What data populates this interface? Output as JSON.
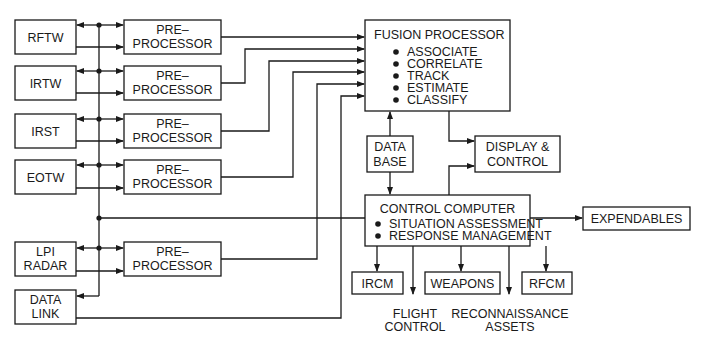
{
  "diagram": {
    "type": "block-diagram",
    "sensors": [
      {
        "id": "rftw",
        "lines": [
          "RFTW"
        ]
      },
      {
        "id": "irtw",
        "lines": [
          "IRTW"
        ]
      },
      {
        "id": "irst",
        "lines": [
          "IRST"
        ]
      },
      {
        "id": "eotw",
        "lines": [
          "EOTW"
        ]
      },
      {
        "id": "lpi",
        "lines": [
          "LPI",
          "RADAR"
        ]
      },
      {
        "id": "datalink",
        "lines": [
          "DATA",
          "LINK"
        ]
      }
    ],
    "preprocessor": {
      "lines": [
        "PRE–",
        "PROCESSOR"
      ]
    },
    "fusion": {
      "title": "FUSION PROCESSOR",
      "items": [
        "ASSOCIATE",
        "CORRELATE",
        "TRACK",
        "ESTIMATE",
        "CLASSIFY"
      ]
    },
    "database": {
      "lines": [
        "DATA",
        "BASE"
      ]
    },
    "display": {
      "lines": [
        "DISPLAY &",
        "CONTROL"
      ]
    },
    "control": {
      "title": "CONTROL COMPUTER",
      "items": [
        "SITUATION ASSESSMENT",
        "RESPONSE MANAGEMENT"
      ]
    },
    "expendables": "EXPENDABLES",
    "outputs": {
      "ircm": "IRCM",
      "weapons": "WEAPONS",
      "rfcm": "RFCM",
      "flight_control": [
        "FLIGHT",
        "CONTROL"
      ],
      "reconnaissance": [
        "RECONNAISSANCE",
        "ASSETS"
      ]
    },
    "colors": {
      "line": "#1a1a1a",
      "background": "#ffffff"
    }
  }
}
